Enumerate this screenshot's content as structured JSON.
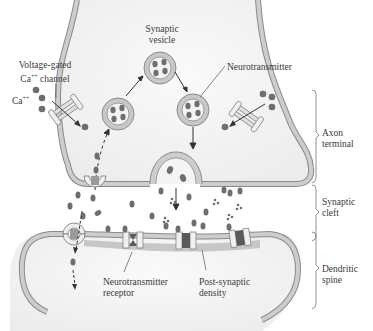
{
  "figure": {
    "type": "synapse-schematic",
    "labels": {
      "synaptic_vesicle": [
        "Synaptic",
        "vesicle"
      ],
      "neurotransmitter": "Neurotransmitter",
      "voltage_gated_channel": [
        "Voltage-gated",
        "Ca",
        "++",
        " channel"
      ],
      "ca_ion": [
        "Ca",
        "++"
      ],
      "neurotransmitter_receptor": [
        "Neurotransmitter",
        "receptor"
      ],
      "post_synaptic_density": [
        "Post-synaptic",
        "density"
      ]
    },
    "regions": [
      {
        "name": "axon-terminal",
        "lines": [
          "Axon",
          "terminal"
        ]
      },
      {
        "name": "synaptic-cleft",
        "lines": [
          "Synaptic",
          "cleft"
        ]
      },
      {
        "name": "dendritic-spine",
        "lines": [
          "Dendritic",
          "spine"
        ]
      }
    ],
    "colors": {
      "membrane_fill": "#c8c8c8",
      "membrane_stroke": "#8a8a8a",
      "cytoplasm": "#f4f4f4",
      "molecule": "#6e6e6e",
      "receptor_dark": "#5a5a5a",
      "psd": "#bcbcbc",
      "text": "#3a3a3a"
    }
  }
}
